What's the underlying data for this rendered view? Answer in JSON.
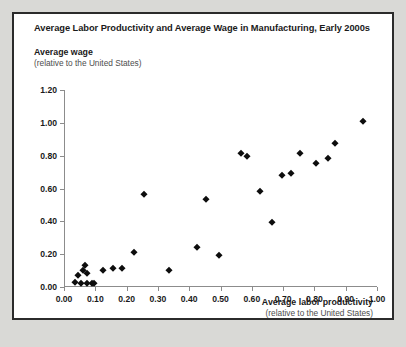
{
  "card": {
    "title": "Average Labor Productivity and Average Wage in Manufacturing, Early 2000s"
  },
  "chart_data": {
    "type": "scatter",
    "title": "Average Labor Productivity and Average Wage in Manufacturing, Early 2000s",
    "xlabel": "Average labor productivity",
    "xlabel_sub": "(relative to the United States)",
    "ylabel": "Average wage",
    "ylabel_sub": "(relative to the United States)",
    "xlim": [
      0.0,
      1.0
    ],
    "ylim": [
      0.0,
      1.2
    ],
    "grid": false,
    "legend": null,
    "marker": "diamond",
    "marker_color": "#0d0d0d",
    "xticks": [
      0.0,
      0.1,
      0.2,
      0.3,
      0.4,
      0.5,
      0.6,
      0.7,
      0.8,
      0.9,
      1.0
    ],
    "xticklabels": [
      "0.00",
      "0.10",
      "0.20",
      "0.30",
      "0.40",
      "0.50",
      "0.60",
      "0.70",
      "0.80",
      "0.90",
      "1.00"
    ],
    "yticks": [
      0.0,
      0.2,
      0.4,
      0.6,
      0.8,
      1.0,
      1.2
    ],
    "yticklabels": [
      "0.00",
      "0.20",
      "0.40",
      "0.60",
      "0.80",
      "1.00",
      "1.20"
    ],
    "points": [
      {
        "x": 0.035,
        "y": 0.03
      },
      {
        "x": 0.045,
        "y": 0.075
      },
      {
        "x": 0.055,
        "y": 0.025
      },
      {
        "x": 0.062,
        "y": 0.105
      },
      {
        "x": 0.068,
        "y": 0.135
      },
      {
        "x": 0.072,
        "y": 0.085
      },
      {
        "x": 0.075,
        "y": 0.025
      },
      {
        "x": 0.088,
        "y": 0.025
      },
      {
        "x": 0.095,
        "y": 0.025
      },
      {
        "x": 0.125,
        "y": 0.105
      },
      {
        "x": 0.155,
        "y": 0.115
      },
      {
        "x": 0.185,
        "y": 0.115
      },
      {
        "x": 0.225,
        "y": 0.215
      },
      {
        "x": 0.255,
        "y": 0.565
      },
      {
        "x": 0.335,
        "y": 0.105
      },
      {
        "x": 0.425,
        "y": 0.245
      },
      {
        "x": 0.455,
        "y": 0.535
      },
      {
        "x": 0.495,
        "y": 0.195
      },
      {
        "x": 0.565,
        "y": 0.815
      },
      {
        "x": 0.585,
        "y": 0.795
      },
      {
        "x": 0.625,
        "y": 0.585
      },
      {
        "x": 0.665,
        "y": 0.395
      },
      {
        "x": 0.695,
        "y": 0.685
      },
      {
        "x": 0.725,
        "y": 0.695
      },
      {
        "x": 0.755,
        "y": 0.815
      },
      {
        "x": 0.805,
        "y": 0.755
      },
      {
        "x": 0.845,
        "y": 0.785
      },
      {
        "x": 0.865,
        "y": 0.875
      },
      {
        "x": 0.955,
        "y": 1.01
      }
    ]
  }
}
